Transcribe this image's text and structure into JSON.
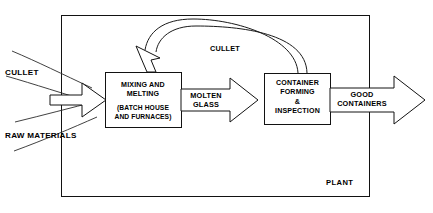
{
  "diagram": {
    "boundary_label": "PLANT",
    "colors": {
      "line": "#121212",
      "text": "#000000",
      "background": "#ffffff"
    },
    "process_boxes": [
      {
        "id": "mixing-melting",
        "line1": "MIXING AND",
        "line2": "MELTING",
        "line3": "(BATCH HOUSE",
        "line4": "AND FURNACES)"
      },
      {
        "id": "container-forming",
        "line1": "CONTAINER",
        "line2": "FORMING",
        "line3": "&",
        "line4": "INSPECTION"
      }
    ],
    "flow_arrows": [
      {
        "id": "input-combined",
        "label": ""
      },
      {
        "id": "molten-glass",
        "label_line1": "MOLTEN",
        "label_line2": "GLASS"
      },
      {
        "id": "good-containers",
        "label_line1": "GOOD",
        "label_line2": "CONTAINERS"
      }
    ],
    "input_streams": [
      {
        "id": "cullet-input",
        "label": "CULLET"
      },
      {
        "id": "raw-materials-input",
        "label": "RAW MATERIALS"
      }
    ],
    "recycle_arc": {
      "id": "cullet-recycle",
      "label": "CULLET"
    }
  }
}
